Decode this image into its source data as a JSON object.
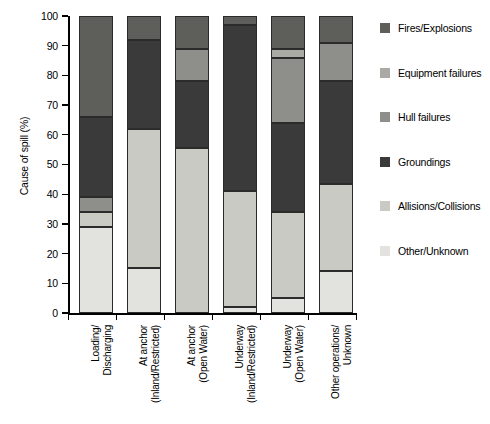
{
  "chart_data": {
    "type": "bar",
    "stacked": true,
    "title": "",
    "xlabel": "",
    "ylabel": "Cause of spill (%)",
    "ylim": [
      0,
      100
    ],
    "yticks": [
      0,
      10,
      20,
      30,
      40,
      50,
      60,
      70,
      80,
      90,
      100
    ],
    "ytick_labels": [
      "0",
      "10",
      "20",
      "30",
      "40",
      "50",
      "60",
      "70",
      "80",
      "90",
      "100"
    ],
    "grid": false,
    "legend_position": "right",
    "categories": [
      "Loading/ Discharging",
      "At anchor (Inland/Restricted)",
      "At anchor (Open Water)",
      "Underway (Inland/Restricted)",
      "Underway (Open Water)",
      "Other operations/ Unknown"
    ],
    "category_lines": [
      [
        "Loading/",
        "Discharging"
      ],
      [
        "At anchor",
        "(Inland/Restricted)"
      ],
      [
        "At anchor",
        "(Open Water)"
      ],
      [
        "Underway",
        "(Inland/Restricted)"
      ],
      [
        "Underway",
        "(Open Water)"
      ],
      [
        "Other operations/",
        "Unknown"
      ]
    ],
    "series": [
      {
        "name": "Other/Unknown",
        "color": "#e2e2de",
        "values": [
          29.0,
          15.0,
          0.0,
          2.0,
          5.0,
          14.0
        ]
      },
      {
        "name": "Allisions/Collisions",
        "color": "#c9cac4",
        "values": [
          5.0,
          47.0,
          55.5,
          39.0,
          29.0,
          29.5
        ]
      },
      {
        "name": "Groundings",
        "color": "#3a3a3a",
        "values": [
          0.0,
          0.0,
          0.0,
          0.0,
          0.0,
          0.0
        ]
      },
      {
        "name": "Hull failures",
        "color": "#8e8f8a",
        "values": [
          5.0,
          0.0,
          11.0,
          0.0,
          22.0,
          13.0
        ]
      },
      {
        "name": "Equipment failures",
        "color": "#a9aaa4",
        "values": [
          0.0,
          0.0,
          0.0,
          0.0,
          3.0,
          0.0
        ]
      },
      {
        "name": "Fires/Explosions",
        "color": "#5e5f5a",
        "values": [
          0.0,
          0.0,
          0.0,
          0.0,
          0.0,
          0.0
        ]
      }
    ],
    "stack_order_bottom_to_top": [
      "Other/Unknown",
      "Allisions/Collisions",
      "Hull failures",
      "Groundings",
      "Equipment failures",
      "Fires/Explosions"
    ],
    "bars": [
      {
        "category": "Loading/ Discharging",
        "segments": [
          {
            "name": "Other/Unknown",
            "from": 0.0,
            "to": 29.0,
            "value": 29.0
          },
          {
            "name": "Allisions/Collisions",
            "from": 29.0,
            "to": 34.0,
            "value": 5.0
          },
          {
            "name": "Hull failures",
            "from": 34.0,
            "to": 39.0,
            "value": 5.0
          },
          {
            "name": "Groundings",
            "from": 39.0,
            "to": 66.0,
            "value": 27.0
          },
          {
            "name": "Fires/Explosions",
            "from": 66.0,
            "to": 100.0,
            "value": 34.0
          }
        ]
      },
      {
        "category": "At anchor (Inland/Restricted)",
        "segments": [
          {
            "name": "Other/Unknown",
            "from": 0.0,
            "to": 15.0,
            "value": 15.0
          },
          {
            "name": "Allisions/Collisions",
            "from": 15.0,
            "to": 62.0,
            "value": 47.0
          },
          {
            "name": "Groundings",
            "from": 62.0,
            "to": 92.0,
            "value": 30.0
          },
          {
            "name": "Fires/Explosions",
            "from": 92.0,
            "to": 100.0,
            "value": 8.0
          }
        ]
      },
      {
        "category": "At anchor (Open Water)",
        "segments": [
          {
            "name": "Allisions/Collisions",
            "from": 0.0,
            "to": 55.5,
            "value": 55.5
          },
          {
            "name": "Groundings",
            "from": 55.5,
            "to": 78.0,
            "value": 22.5
          },
          {
            "name": "Hull failures",
            "from": 78.0,
            "to": 89.0,
            "value": 11.0
          },
          {
            "name": "Fires/Explosions",
            "from": 89.0,
            "to": 100.0,
            "value": 11.0
          }
        ]
      },
      {
        "category": "Underway (Inland/Restricted)",
        "segments": [
          {
            "name": "Other/Unknown",
            "from": 0.0,
            "to": 2.0,
            "value": 2.0
          },
          {
            "name": "Allisions/Collisions",
            "from": 2.0,
            "to": 41.0,
            "value": 39.0
          },
          {
            "name": "Groundings",
            "from": 41.0,
            "to": 97.0,
            "value": 56.0
          },
          {
            "name": "Fires/Explosions",
            "from": 97.0,
            "to": 100.0,
            "value": 3.0
          }
        ]
      },
      {
        "category": "Underway (Open Water)",
        "segments": [
          {
            "name": "Other/Unknown",
            "from": 0.0,
            "to": 5.0,
            "value": 5.0
          },
          {
            "name": "Allisions/Collisions",
            "from": 5.0,
            "to": 34.0,
            "value": 29.0
          },
          {
            "name": "Groundings",
            "from": 34.0,
            "to": 64.0,
            "value": 30.0
          },
          {
            "name": "Hull failures",
            "from": 64.0,
            "to": 86.0,
            "value": 22.0
          },
          {
            "name": "Equipment failures",
            "from": 86.0,
            "to": 89.0,
            "value": 3.0
          },
          {
            "name": "Fires/Explosions",
            "from": 89.0,
            "to": 100.0,
            "value": 11.0
          }
        ]
      },
      {
        "category": "Other operations/ Unknown",
        "segments": [
          {
            "name": "Other/Unknown",
            "from": 0.0,
            "to": 14.0,
            "value": 14.0
          },
          {
            "name": "Allisions/Collisions",
            "from": 14.0,
            "to": 43.5,
            "value": 29.5
          },
          {
            "name": "Groundings",
            "from": 43.5,
            "to": 78.0,
            "value": 34.5
          },
          {
            "name": "Hull failures",
            "from": 78.0,
            "to": 91.0,
            "value": 13.0
          },
          {
            "name": "Fires/Explosions",
            "from": 91.0,
            "to": 100.0,
            "value": 9.0
          }
        ]
      }
    ],
    "legend": [
      {
        "label": "Fires/Explosions",
        "color": "#5e5f5a"
      },
      {
        "label": "Equipment failures",
        "color": "#a9aaa4"
      },
      {
        "label": "Hull failures",
        "color": "#8e8f8a"
      },
      {
        "label": "Groundings",
        "color": "#3a3a3a"
      },
      {
        "label": "Allisions/Collisions",
        "color": "#c9cac4"
      },
      {
        "label": "Other/Unknown",
        "color": "#e2e2de"
      }
    ]
  }
}
